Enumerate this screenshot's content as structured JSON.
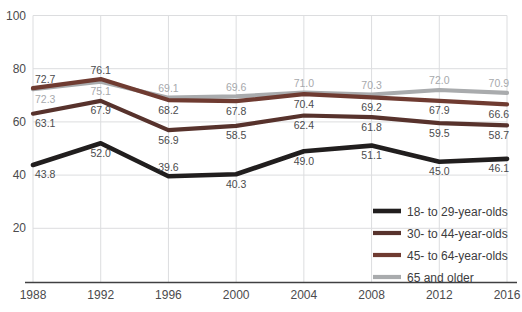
{
  "figure": {
    "background": "#ffffff"
  },
  "chart_data": {
    "type": "line",
    "title": "",
    "xlabel": "",
    "ylabel": "",
    "x_labels": [
      "1988",
      "1992",
      "1996",
      "2000",
      "2004",
      "2008",
      "2012",
      "2016"
    ],
    "y_ticks": [
      20,
      40,
      60,
      80,
      100
    ],
    "ylim": [
      0,
      100
    ],
    "grid": true,
    "legend_position": "inside-bottom-right",
    "series": [
      {
        "name": "18- to 29-year-olds",
        "color": "#211e1e",
        "line_width": 4.6,
        "values": [
          43.8,
          52.0,
          39.6,
          40.3,
          49.0,
          51.1,
          45.0,
          46.1
        ],
        "labels": [
          "43.8",
          "52.0",
          "39.6",
          "40.3",
          "49.0",
          "51.1",
          "45.0",
          "46.1"
        ],
        "label_positions": [
          "below",
          "below",
          "above",
          "below",
          "below",
          "below",
          "below",
          "below"
        ],
        "label_color": "#4b4b4d"
      },
      {
        "name": "30- to 44-year-olds",
        "color": "#57322c",
        "line_width": 4.2,
        "values": [
          63.1,
          67.9,
          56.9,
          58.5,
          62.4,
          61.8,
          59.5,
          58.7
        ],
        "labels": [
          "63.1",
          "67.9",
          "56.9",
          "58.5",
          "62.4",
          "61.8",
          "59.5",
          "58.7"
        ],
        "label_positions": [
          "below",
          "below",
          "below",
          "below",
          "below",
          "below",
          "below",
          "below"
        ],
        "label_color": "#4b4b4d"
      },
      {
        "name": "45- to 64-year-olds",
        "color": "#6f3b31",
        "line_width": 4.2,
        "values": [
          72.7,
          76.1,
          68.2,
          67.8,
          70.4,
          69.2,
          67.9,
          66.6
        ],
        "labels": [
          "72.7",
          "76.1",
          "68.2",
          "67.8",
          "70.4",
          "69.2",
          "67.9",
          "66.6"
        ],
        "label_positions": [
          "above",
          "above",
          "below",
          "below",
          "below",
          "below",
          "below",
          "below"
        ],
        "label_color": "#4b4b4d"
      },
      {
        "name": "65 and older",
        "color": "#a9abad",
        "line_width": 4.2,
        "values": [
          72.3,
          75.1,
          69.1,
          69.6,
          71.0,
          70.3,
          72.0,
          70.9
        ],
        "labels": [
          "72.3",
          "75.1",
          "69.1",
          "69.6",
          "71.0",
          "70.3",
          "72.0",
          "70.9"
        ],
        "label_positions": [
          "below",
          "below",
          "above",
          "above",
          "above",
          "above",
          "above",
          "above"
        ],
        "label_color": "#a7a9ac"
      }
    ],
    "style": {
      "grid_color": "#dcdddf",
      "axis_color": "#404042",
      "tick_label_color": "#4b4b4d",
      "legend_text_color": "#3c3c3e"
    }
  }
}
